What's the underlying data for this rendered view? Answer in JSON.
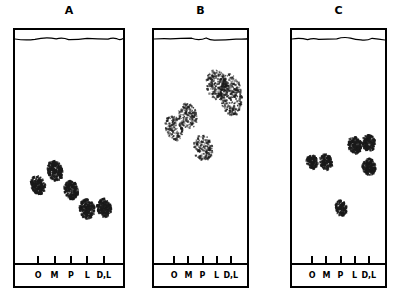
{
  "figure": {
    "type": "thin-layer-chromatogram",
    "panel_count": 3,
    "lane_labels": [
      "O",
      "M",
      "P",
      "L",
      "D,L"
    ],
    "colors": {
      "ink": "#000000",
      "plate_background": "#ffffff",
      "spot": "#1a1a1a"
    }
  },
  "chart_data": {
    "type": "scatter",
    "title": "",
    "xlabel": "",
    "ylabel": "",
    "grid": false,
    "legend": "none",
    "x": [
      "O",
      "M",
      "P",
      "L",
      "D,L"
    ],
    "xlim": [
      0,
      1
    ],
    "ylim": [
      0,
      1
    ],
    "series": [
      {
        "name": "A",
        "panel": "A",
        "spot_count": 5,
        "spots": [
          {
            "lane": "O",
            "lane_index": 0,
            "rf": 0.355,
            "width": 14,
            "height": 19,
            "density": "dense",
            "angle": -14
          },
          {
            "lane": "M",
            "lane_index": 1,
            "rf": 0.415,
            "width": 15,
            "height": 21,
            "density": "dense",
            "angle": -12
          },
          {
            "lane": "P",
            "lane_index": 2,
            "rf": 0.33,
            "width": 14,
            "height": 19,
            "density": "dense",
            "angle": -10
          },
          {
            "lane": "L",
            "lane_index": 3,
            "rf": 0.245,
            "width": 15,
            "height": 20,
            "density": "dense",
            "angle": -8
          },
          {
            "lane": "D,L",
            "lane_index": 4,
            "rf": 0.25,
            "width": 14,
            "height": 19,
            "density": "dense",
            "angle": -8
          }
        ]
      },
      {
        "name": "B",
        "panel": "B",
        "spot_count": 5,
        "spots": [
          {
            "lane": "O",
            "lane_index": 0,
            "rf": 0.61,
            "width": 17,
            "height": 26,
            "density": "diffuse",
            "angle": -16
          },
          {
            "lane": "M",
            "lane_index": 1,
            "rf": 0.665,
            "width": 18,
            "height": 28,
            "density": "diffuse",
            "angle": -18
          },
          {
            "lane": "P",
            "lane_index": 2,
            "rf": 0.52,
            "width": 19,
            "height": 26,
            "density": "diffuse",
            "angle": -8
          },
          {
            "lane": "L",
            "lane_index": 3,
            "rf": 0.805,
            "width": 22,
            "height": 30,
            "density": "diffuse",
            "angle": -10
          },
          {
            "lane": "D,L",
            "lane_index": 4,
            "rf": 0.76,
            "width": 22,
            "height": 42,
            "density": "diffuse",
            "angle": -6
          }
        ]
      },
      {
        "name": "C",
        "panel": "C",
        "spot_count": 6,
        "spots": [
          {
            "lane": "O",
            "lane_index": 0,
            "rf": 0.455,
            "width": 11,
            "height": 14,
            "density": "dense",
            "angle": -10
          },
          {
            "lane": "M",
            "lane_index": 1,
            "rf": 0.455,
            "width": 12,
            "height": 16,
            "density": "dense",
            "angle": -10
          },
          {
            "lane": "P",
            "lane_index": 2,
            "rf": 0.25,
            "width": 11,
            "height": 16,
            "density": "dense",
            "angle": -8
          },
          {
            "lane": "L",
            "lane_index": 3,
            "rf": 0.535,
            "width": 13,
            "height": 17,
            "density": "dense",
            "angle": -12
          },
          {
            "lane": "D,L",
            "lane_index": 4,
            "rf": 0.545,
            "width": 13,
            "height": 17,
            "density": "dense",
            "angle": -10
          },
          {
            "lane": "D,L",
            "lane_index": 4,
            "rf": 0.435,
            "width": 13,
            "height": 17,
            "density": "dense",
            "angle": -8
          }
        ]
      }
    ]
  },
  "panels": [
    {
      "label": "A",
      "left": 13,
      "right": 125,
      "top": 28,
      "bottom": 288,
      "baseline_y": 263
    },
    {
      "label": "B",
      "left": 152,
      "right": 249,
      "top": 28,
      "bottom": 288,
      "baseline_y": 263
    },
    {
      "label": "C",
      "left": 290,
      "right": 387,
      "top": 28,
      "bottom": 288,
      "baseline_y": 263
    }
  ]
}
